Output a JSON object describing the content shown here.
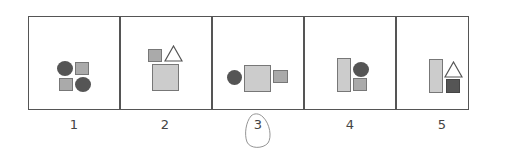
{
  "panels": [
    {
      "label": "1",
      "shapes": [
        "dark-circle",
        "gray-square",
        "gray-square",
        "dark-circle"
      ]
    },
    {
      "label": "2",
      "shapes": [
        "gray-square",
        "outline-triangle",
        "large-light-square"
      ]
    },
    {
      "label": "3",
      "shapes": [
        "dark-circle",
        "large-light-square",
        "gray-square"
      ],
      "circled": true
    },
    {
      "label": "4",
      "shapes": [
        "tall-light-rectangle",
        "dark-circle",
        "gray-square"
      ]
    },
    {
      "label": "5",
      "shapes": [
        "tall-light-rectangle",
        "outline-triangle",
        "dark-square"
      ]
    }
  ],
  "colors": {
    "dark": "#555555",
    "gray": "#aaaaaa",
    "light": "#cccccc",
    "border": "#555555"
  }
}
